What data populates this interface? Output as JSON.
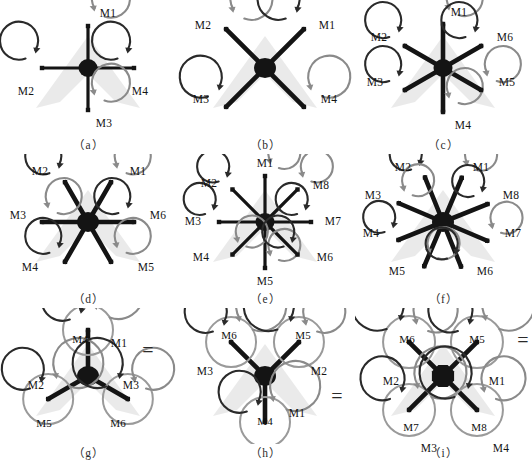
{
  "figure": {
    "background": "#ffffff",
    "ink": "#141414",
    "ghost_color": "#b8b8b8",
    "arrow_cw_color": "#2a2a2a",
    "arrow_ccw_color": "#8a8a8a"
  },
  "panels": [
    {
      "id": "a",
      "caption": "（a）",
      "type": "quad-plus",
      "equals": null,
      "motors": [
        {
          "label": "M1",
          "lx": 108,
          "ly": 14,
          "spin": "ccw"
        },
        {
          "label": "M2",
          "lx": 26,
          "ly": 92,
          "spin": "cw"
        },
        {
          "label": "M3",
          "lx": 104,
          "ly": 124,
          "spin": "ccw"
        },
        {
          "label": "M4",
          "lx": 140,
          "ly": 92,
          "spin": "cw"
        }
      ]
    },
    {
      "id": "b",
      "caption": "（b）",
      "type": "quad-x",
      "equals": null,
      "motors": [
        {
          "label": "M2",
          "lx": 26,
          "ly": 26,
          "spin": "ccw"
        },
        {
          "label": "M1",
          "lx": 150,
          "ly": 26,
          "spin": "cw"
        },
        {
          "label": "M3",
          "lx": 24,
          "ly": 100,
          "spin": "cw"
        },
        {
          "label": "M4",
          "lx": 152,
          "ly": 100,
          "spin": "ccw"
        }
      ]
    },
    {
      "id": "c",
      "caption": "（c）",
      "type": "hex-plus",
      "equals": null,
      "motors": [
        {
          "label": "M1",
          "lx": 104,
          "ly": 13,
          "spin": "ccw"
        },
        {
          "label": "M2",
          "lx": 24,
          "ly": 38,
          "spin": "cw"
        },
        {
          "label": "M6",
          "lx": 150,
          "ly": 38,
          "spin": "cw"
        },
        {
          "label": "M3",
          "lx": 20,
          "ly": 83,
          "spin": "ccw"
        },
        {
          "label": "M5",
          "lx": 152,
          "ly": 83,
          "spin": "ccw"
        },
        {
          "label": "M4",
          "lx": 108,
          "ly": 126,
          "spin": "cw"
        }
      ]
    },
    {
      "id": "d",
      "caption": "（d）",
      "type": "hex-x",
      "equals": null,
      "motors": [
        {
          "label": "M2",
          "lx": 40,
          "ly": 18,
          "spin": "cw"
        },
        {
          "label": "M1",
          "lx": 138,
          "ly": 18,
          "spin": "ccw"
        },
        {
          "label": "M3",
          "lx": 18,
          "ly": 62,
          "spin": "ccw"
        },
        {
          "label": "M6",
          "lx": 158,
          "ly": 62,
          "spin": "cw"
        },
        {
          "label": "M4",
          "lx": 30,
          "ly": 114,
          "spin": "cw"
        },
        {
          "label": "M5",
          "lx": 146,
          "ly": 114,
          "spin": "ccw"
        }
      ]
    },
    {
      "id": "e",
      "caption": "（e）",
      "type": "octo-plus",
      "equals": null,
      "motors": [
        {
          "label": "M1",
          "lx": 88,
          "ly": 10,
          "spin": "ccw"
        },
        {
          "label": "M2",
          "lx": 32,
          "ly": 30,
          "spin": "cw"
        },
        {
          "label": "M8",
          "lx": 144,
          "ly": 32,
          "spin": "cw"
        },
        {
          "label": "M3",
          "lx": 16,
          "ly": 68,
          "spin": "ccw"
        },
        {
          "label": "M7",
          "lx": 156,
          "ly": 68,
          "spin": "ccw"
        },
        {
          "label": "M4",
          "lx": 24,
          "ly": 104,
          "spin": "cw"
        },
        {
          "label": "M6",
          "lx": 148,
          "ly": 104,
          "spin": "cw"
        },
        {
          "label": "M5",
          "lx": 88,
          "ly": 128,
          "spin": "ccw"
        }
      ]
    },
    {
      "id": "f",
      "caption": "（f）",
      "type": "octo-x",
      "equals": null,
      "motors": [
        {
          "label": "M2",
          "lx": 48,
          "ly": 14,
          "spin": "cw"
        },
        {
          "label": "M1",
          "lx": 126,
          "ly": 14,
          "spin": "ccw"
        },
        {
          "label": "M3",
          "lx": 18,
          "ly": 42,
          "spin": "ccw"
        },
        {
          "label": "M8",
          "lx": 156,
          "ly": 42,
          "spin": "cw"
        },
        {
          "label": "M4",
          "lx": 16,
          "ly": 80,
          "spin": "cw"
        },
        {
          "label": "M7",
          "lx": 158,
          "ly": 80,
          "spin": "ccw"
        },
        {
          "label": "M5",
          "lx": 42,
          "ly": 118,
          "spin": "ccw"
        },
        {
          "label": "M6",
          "lx": 130,
          "ly": 118,
          "spin": "cw"
        }
      ]
    },
    {
      "id": "g",
      "caption": "（g）",
      "type": "y6",
      "equals": "=",
      "motors": [
        {
          "label": "M4",
          "lx": 80,
          "ly": 32,
          "spin": "cw",
          "inner": true
        },
        {
          "label": "M1",
          "lx": 119,
          "ly": 36,
          "spin": "ccw"
        },
        {
          "label": "M2",
          "lx": 36,
          "ly": 78,
          "spin": "cw"
        },
        {
          "label": "M5",
          "lx": 44,
          "ly": 116,
          "spin": "ccw",
          "inner": true
        },
        {
          "label": "M3",
          "lx": 131,
          "ly": 78,
          "spin": "ccw"
        },
        {
          "label": "M6",
          "lx": 118,
          "ly": 116,
          "spin": "cw",
          "inner": true
        }
      ]
    },
    {
      "id": "h",
      "caption": "（h）",
      "type": "y6-inv",
      "equals": "=",
      "motors": [
        {
          "label": "M6",
          "lx": 52,
          "ly": 28,
          "spin": "cw",
          "inner": true
        },
        {
          "label": "M3",
          "lx": 28,
          "ly": 64,
          "spin": "ccw"
        },
        {
          "label": "M5",
          "lx": 126,
          "ly": 28,
          "spin": "ccw",
          "inner": true
        },
        {
          "label": "M2",
          "lx": 142,
          "ly": 64,
          "spin": "cw"
        },
        {
          "label": "M4",
          "lx": 88,
          "ly": 114,
          "spin": "cw",
          "inner": true
        },
        {
          "label": "M1",
          "lx": 120,
          "ly": 106,
          "spin": "ccw"
        }
      ]
    },
    {
      "id": "i",
      "caption": "（i）",
      "type": "x8",
      "equals": "=",
      "motors": [
        {
          "label": "M6",
          "lx": 52,
          "ly": 32,
          "spin": "ccw",
          "inner": true
        },
        {
          "label": "M2",
          "lx": 36,
          "ly": 74,
          "spin": "cw"
        },
        {
          "label": "M5",
          "lx": 122,
          "ly": 32,
          "spin": "cw",
          "inner": true
        },
        {
          "label": "M1",
          "lx": 142,
          "ly": 74,
          "spin": "ccw"
        },
        {
          "label": "M7",
          "lx": 56,
          "ly": 120,
          "spin": "cw",
          "inner": true
        },
        {
          "label": "M3",
          "lx": 74,
          "ly": 141,
          "spin": "ccw"
        },
        {
          "label": "M8",
          "lx": 124,
          "ly": 120,
          "spin": "ccw",
          "inner": true
        },
        {
          "label": "M4",
          "lx": 146,
          "ly": 141,
          "spin": "cw"
        }
      ]
    }
  ]
}
